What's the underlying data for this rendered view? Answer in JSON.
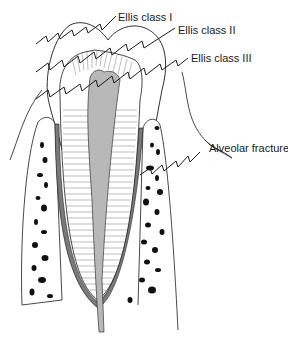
{
  "figure": {
    "type": "tooth-fracture-classification-diagram",
    "labels": {
      "ellis_1": "Ellis class I",
      "ellis_2": "Ellis class II",
      "ellis_3": "Ellis class III",
      "alveolar": "Alveolar fracture"
    },
    "colors": {
      "line": "#1a1a1a",
      "pulp": "#b8b8b8",
      "pdl": "#7a7a7a",
      "bone_spot": "#111111",
      "background": "#ffffff"
    }
  }
}
